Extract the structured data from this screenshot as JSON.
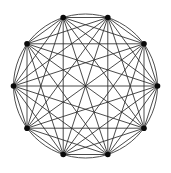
{
  "figure": {
    "background_color": "#ffffff",
    "width": 171,
    "height": 173
  },
  "chart_data": {
    "type": "diagram",
    "diagram_type": "complete-graph",
    "subtitle": "",
    "xlabel": "",
    "ylabel": "",
    "legend": [],
    "annotations": [],
    "grid": false,
    "vertex_count": 10,
    "edge_count": 45,
    "layout": "circular",
    "center": {
      "x": 85.5,
      "y": 86.0
    },
    "radius": 72.0,
    "start_angle_deg": -72,
    "vertex_radius_px": 2.8,
    "vertex_color": "#0a0a0a",
    "edge_color": "#2b2b2b",
    "edge_width": 0.85,
    "outline_color": "#3a3a3a",
    "outline_width": 0.9,
    "show_circle_outline": true,
    "vertices": [
      {
        "id": 0,
        "label": "v1",
        "x": 63.2,
        "y": 17.5
      },
      {
        "id": 1,
        "label": "v2",
        "x": 107.8,
        "y": 17.5
      },
      {
        "id": 2,
        "label": "v3",
        "x": 144.0,
        "y": 43.8
      },
      {
        "id": 3,
        "label": "v4",
        "x": 157.5,
        "y": 86.0
      },
      {
        "id": 4,
        "label": "v5",
        "x": 144.0,
        "y": 128.2
      },
      {
        "id": 5,
        "label": "v6",
        "x": 107.8,
        "y": 154.5
      },
      {
        "id": 6,
        "label": "v7",
        "x": 63.2,
        "y": 154.5
      },
      {
        "id": 7,
        "label": "v8",
        "x": 27.0,
        "y": 128.2
      },
      {
        "id": 8,
        "label": "v9",
        "x": 13.5,
        "y": 86.0
      },
      {
        "id": 9,
        "label": "v10",
        "x": 27.0,
        "y": 43.8
      }
    ],
    "edges": [
      [
        0,
        1
      ],
      [
        0,
        2
      ],
      [
        0,
        3
      ],
      [
        0,
        4
      ],
      [
        0,
        5
      ],
      [
        0,
        6
      ],
      [
        0,
        7
      ],
      [
        0,
        8
      ],
      [
        0,
        9
      ],
      [
        1,
        2
      ],
      [
        1,
        3
      ],
      [
        1,
        4
      ],
      [
        1,
        5
      ],
      [
        1,
        6
      ],
      [
        1,
        7
      ],
      [
        1,
        8
      ],
      [
        1,
        9
      ],
      [
        2,
        3
      ],
      [
        2,
        4
      ],
      [
        2,
        5
      ],
      [
        2,
        6
      ],
      [
        2,
        7
      ],
      [
        2,
        8
      ],
      [
        2,
        9
      ],
      [
        3,
        4
      ],
      [
        3,
        5
      ],
      [
        3,
        6
      ],
      [
        3,
        7
      ],
      [
        3,
        8
      ],
      [
        3,
        9
      ],
      [
        4,
        5
      ],
      [
        4,
        6
      ],
      [
        4,
        7
      ],
      [
        4,
        8
      ],
      [
        4,
        9
      ],
      [
        5,
        6
      ],
      [
        5,
        7
      ],
      [
        5,
        8
      ],
      [
        5,
        9
      ],
      [
        6,
        7
      ],
      [
        6,
        8
      ],
      [
        6,
        9
      ],
      [
        7,
        8
      ],
      [
        7,
        9
      ],
      [
        8,
        9
      ]
    ]
  }
}
